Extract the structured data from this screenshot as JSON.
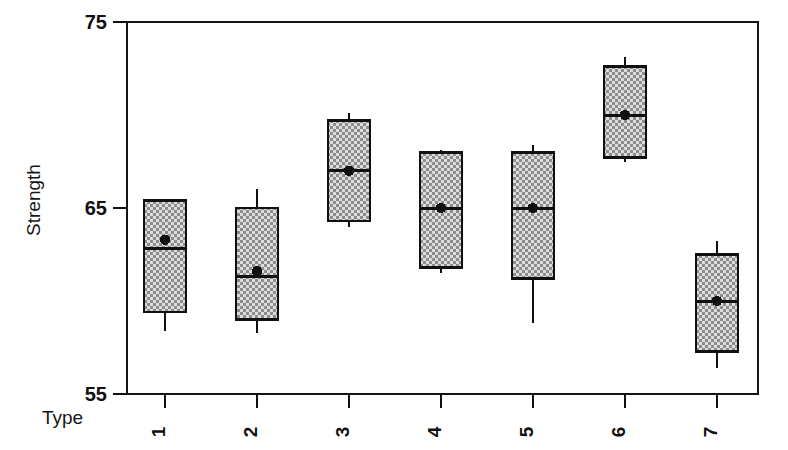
{
  "chart_data": {
    "type": "box",
    "title": "",
    "subtitle": "",
    "xlabel": "Type",
    "ylabel": "Strength",
    "categories": [
      "1",
      "2",
      "3",
      "4",
      "5",
      "6",
      "7"
    ],
    "ytick_labels": [
      "55",
      "65",
      "75"
    ],
    "yticks": [
      55,
      65,
      75
    ],
    "ylim": [
      55,
      75
    ],
    "grid": false,
    "legend": null,
    "mean_marker": "filled-circle",
    "box_fill": "#d8d8d8",
    "box_pattern": "cross-hatch-dots",
    "line_color": "#101010",
    "boxes": [
      {
        "category": "1",
        "whisker_low": 58.4,
        "q1": 59.4,
        "median": 62.8,
        "q3": 65.4,
        "whisker_high": 65.4,
        "mean": 63.3
      },
      {
        "category": "2",
        "whisker_low": 58.3,
        "q1": 59.0,
        "median": 61.3,
        "q3": 65.0,
        "whisker_high": 66.0,
        "mean": 61.6
      },
      {
        "category": "3",
        "whisker_low": 64.0,
        "q1": 64.3,
        "median": 67.0,
        "q3": 69.7,
        "whisker_high": 70.1,
        "mean": 67.0
      },
      {
        "category": "4",
        "whisker_low": 61.5,
        "q1": 61.8,
        "median": 65.0,
        "q3": 68.0,
        "whisker_high": 68.1,
        "mean": 65.0
      },
      {
        "category": "5",
        "whisker_low": 58.8,
        "q1": 61.2,
        "median": 65.0,
        "q3": 68.0,
        "whisker_high": 68.4,
        "mean": 65.0
      },
      {
        "category": "6",
        "whisker_low": 67.5,
        "q1": 67.7,
        "median": 70.0,
        "q3": 72.6,
        "whisker_high": 73.1,
        "mean": 70.0
      },
      {
        "category": "7",
        "whisker_low": 56.4,
        "q1": 57.3,
        "median": 60.0,
        "q3": 62.5,
        "whisker_high": 63.2,
        "mean": 60.0
      }
    ]
  },
  "axis": {
    "y_title": "Strength",
    "x_title": "Type"
  }
}
